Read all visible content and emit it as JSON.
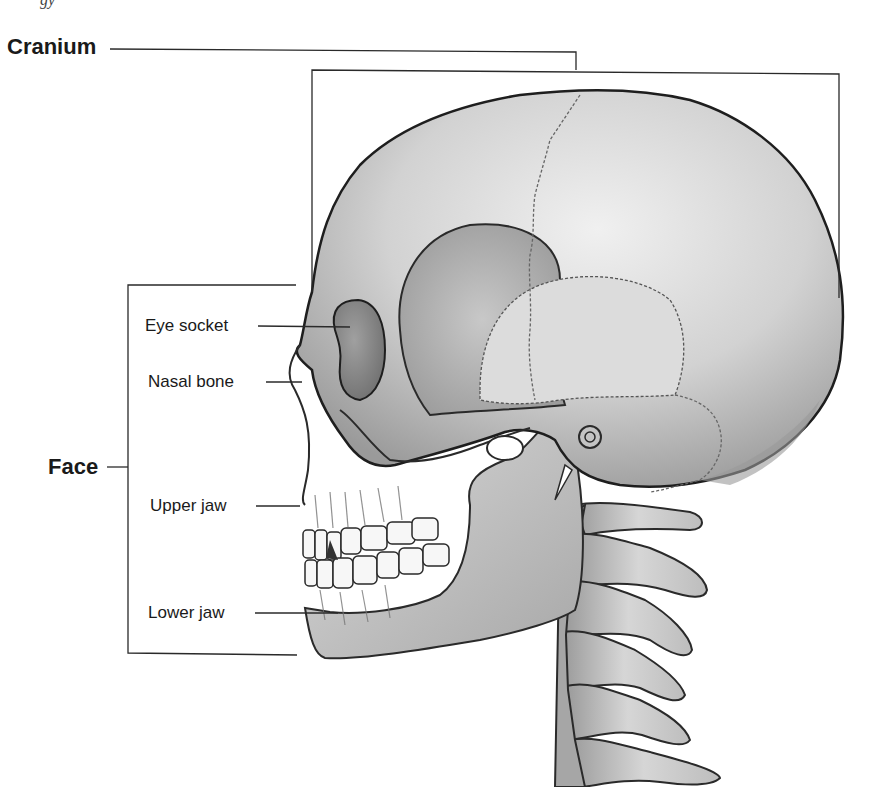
{
  "caption_fragment": "gy",
  "groups": {
    "cranium": {
      "label": "Cranium"
    },
    "face": {
      "label": "Face"
    }
  },
  "parts": [
    {
      "id": "eye-socket",
      "label": "Eye socket"
    },
    {
      "id": "nasal-bone",
      "label": "Nasal bone"
    },
    {
      "id": "upper-jaw",
      "label": "Upper jaw"
    },
    {
      "id": "lower-jaw",
      "label": "Lower jaw"
    }
  ],
  "illustration": {
    "subject": "Lateral view of human skull with cervical vertebrae",
    "colors": {
      "line": "#2a2a2a",
      "bone_light": "#e6e6e6",
      "bone_mid": "#b9b9b9",
      "bone_dark": "#8a8a8a",
      "background": "#ffffff"
    }
  }
}
